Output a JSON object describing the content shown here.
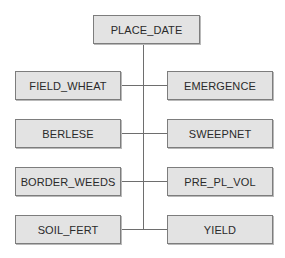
{
  "diagram": {
    "root": {
      "label": "PLACE_DATE"
    },
    "left": [
      {
        "label": "FIELD_WHEAT"
      },
      {
        "label": "BERLESE"
      },
      {
        "label": "BORDER_WEEDS"
      },
      {
        "label": "SOIL_FERT"
      }
    ],
    "right": [
      {
        "label": "EMERGENCE"
      },
      {
        "label": "SWEEPNET"
      },
      {
        "label": "PRE_PL_VOL"
      },
      {
        "label": "YIELD"
      }
    ],
    "colors": {
      "box_fill": "#e3e3e3",
      "box_border": "#7d7d7d",
      "line": "#6e6e6e"
    }
  }
}
